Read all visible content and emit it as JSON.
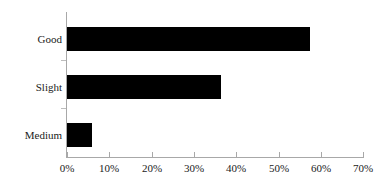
{
  "chart_data": {
    "type": "bar",
    "orientation": "horizontal",
    "title": "",
    "subtitle": "",
    "xlabel": "",
    "ylabel": "",
    "categories": [
      "Good",
      "Slight",
      "Medium"
    ],
    "values": [
      57.5,
      36.5,
      5.8
    ],
    "value_suffix": "%",
    "xlim": [
      0,
      70
    ],
    "xticks": [
      0,
      10,
      20,
      30,
      40,
      50,
      60,
      70
    ],
    "xtick_labels": [
      "0%",
      "10%",
      "20%",
      "30%",
      "40%",
      "50%",
      "60%",
      "70%"
    ],
    "grid": false,
    "legend": false,
    "legend_position": "none",
    "series": [
      {
        "name": "",
        "values": [
          57.5,
          36.5,
          5.8
        ]
      }
    ],
    "bar_color": "#000000",
    "axis_color": "#a8a8a8",
    "background_color": "#ffffff",
    "text_color": "#1a1a1a"
  },
  "axis": {
    "x": {
      "ticks": [
        {
          "value": 0,
          "label": "0%"
        },
        {
          "value": 10,
          "label": "10%"
        },
        {
          "value": 20,
          "label": "20%"
        },
        {
          "value": 30,
          "label": "30%"
        },
        {
          "value": 40,
          "label": "40%"
        },
        {
          "value": 50,
          "label": "50%"
        },
        {
          "value": 60,
          "label": "60%"
        },
        {
          "value": 70,
          "label": "70%"
        }
      ]
    },
    "y": {
      "ticks": [
        {
          "label": "Good"
        },
        {
          "label": "Slight"
        },
        {
          "label": "Medium"
        }
      ]
    }
  },
  "bars": [
    {
      "label": "Good",
      "value": 57.5
    },
    {
      "label": "Slight",
      "value": 36.5
    },
    {
      "label": "Medium",
      "value": 5.8
    }
  ]
}
